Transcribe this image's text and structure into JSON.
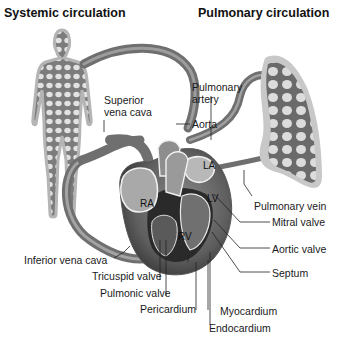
{
  "titles": {
    "systemic": "Systemic circulation",
    "pulmonary": "Pulmonary circulation"
  },
  "chambers": {
    "ra": "RA",
    "la": "LA",
    "lv": "LV",
    "rv": "RV"
  },
  "labels": {
    "superior_vena_cava_1": "Superior",
    "superior_vena_cava_2": "vena cava",
    "pulmonary_artery_1": "Pulmonary",
    "pulmonary_artery_2": "artery",
    "aorta": "Aorta",
    "pulmonary_vein": "Pulmonary vein",
    "mitral_valve": "Mitral valve",
    "aortic_valve": "Aortic valve",
    "septum": "Septum",
    "inferior_vena_cava": "Inferior vena cava",
    "tricuspid_valve": "Tricuspid valve",
    "pulmonic_valve": "Pulmonic valve",
    "pericardium": "Pericardium",
    "myocardium": "Myocardium",
    "endocardium": "Endocardium"
  },
  "colors": {
    "vessel": "#7a7a7a",
    "vessel_light": "#a8a8a8",
    "heart_dark": "#2a2a2a",
    "heart_mid": "#6e6e6e",
    "tissue_light": "#cfcfcf",
    "body_outline": "#9a9a9a"
  }
}
